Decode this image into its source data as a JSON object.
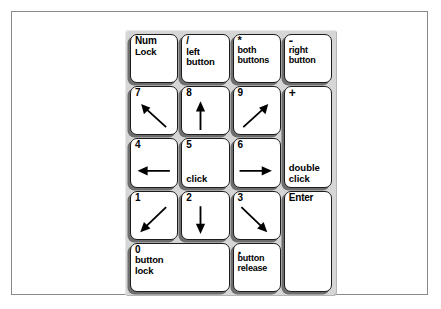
{
  "diagram": {
    "keypad_background": "#d6d6d6",
    "key_background": "#ffffff",
    "key_border": "#1c1c1c",
    "key_shadow": "#6e6e6e",
    "page_background": "#ffffff",
    "frame_border": "#888a8c"
  },
  "keys": {
    "numlock": {
      "corner": "Num",
      "line2": "Lock"
    },
    "divide": {
      "corner": "/",
      "line2": "left",
      "line3": "button"
    },
    "multiply": {
      "corner": "*",
      "line2": "both",
      "line3": "buttons"
    },
    "minus": {
      "corner": "-",
      "line2": "right",
      "line3": "button"
    },
    "k7": {
      "corner": "7",
      "arrow": "up-left"
    },
    "k8": {
      "corner": "8",
      "arrow": "up"
    },
    "k9": {
      "corner": "9",
      "arrow": "up-right"
    },
    "plus": {
      "corner": "+",
      "line2": "double",
      "line3": "click"
    },
    "k4": {
      "corner": "4",
      "arrow": "left"
    },
    "k5": {
      "corner": "5",
      "line2": "click"
    },
    "k6": {
      "corner": "6",
      "arrow": "right"
    },
    "k1": {
      "corner": "1",
      "arrow": "down-left"
    },
    "k2": {
      "corner": "2",
      "arrow": "down"
    },
    "k3": {
      "corner": "3",
      "arrow": "down-right"
    },
    "enter": {
      "corner": "Enter"
    },
    "k0": {
      "corner": "0",
      "line2": "button",
      "line3": "lock"
    },
    "period": {
      "corner": ".",
      "line2": "button",
      "line3": "release"
    }
  }
}
